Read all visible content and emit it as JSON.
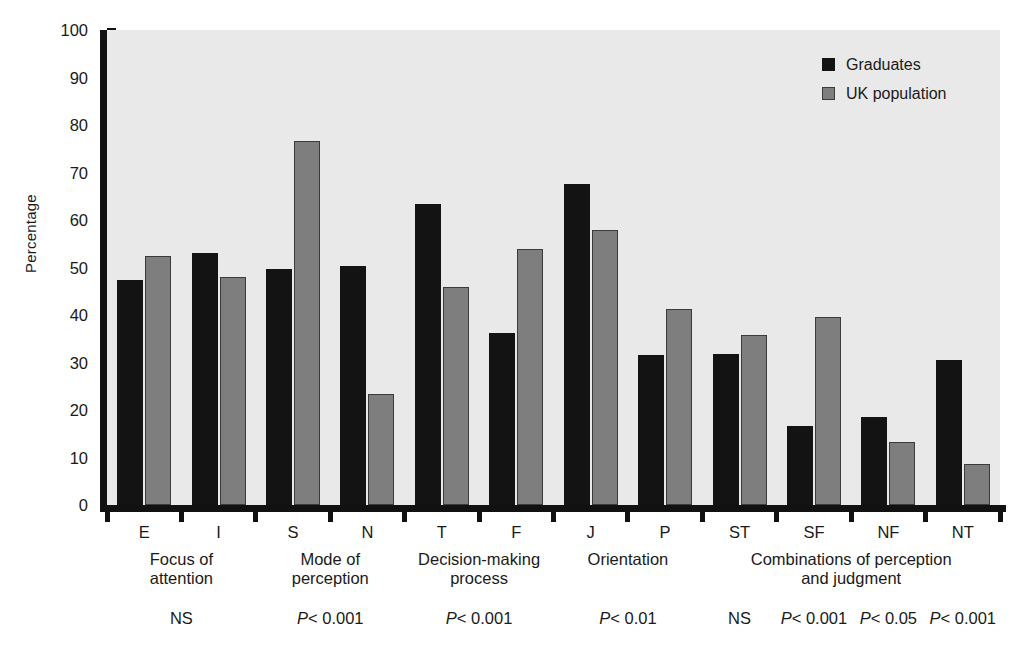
{
  "chart_data": {
    "type": "bar",
    "title": "",
    "xlabel": "",
    "ylabel": "Percentage",
    "ylim": [
      0,
      100
    ],
    "ytick_values": [
      0,
      10,
      20,
      30,
      40,
      50,
      60,
      70,
      80,
      90,
      100
    ],
    "grid": false,
    "legend_position": "top-right",
    "categories": [
      "E",
      "I",
      "S",
      "N",
      "T",
      "F",
      "J",
      "P",
      "ST",
      "SF",
      "NF",
      "NT"
    ],
    "series": [
      {
        "name": "Graduates",
        "color": "#131313",
        "values": [
          47.3,
          53.0,
          49.6,
          50.3,
          63.4,
          36.2,
          67.6,
          31.6,
          31.8,
          16.6,
          18.5,
          30.6
        ]
      },
      {
        "name": "UK population",
        "color": "#7e7e7e",
        "values": [
          52.4,
          47.9,
          76.6,
          23.4,
          45.8,
          54.0,
          57.8,
          41.3,
          35.8,
          39.5,
          13.2,
          8.7
        ]
      }
    ],
    "groups": [
      {
        "label": "Focus of\nattention",
        "categories": [
          "E",
          "I"
        ],
        "significance": "NS",
        "significance_italic": false
      },
      {
        "label": "Mode of\nperception",
        "categories": [
          "S",
          "N"
        ],
        "significance": "P< 0.001",
        "significance_italic": true
      },
      {
        "label": "Decision-making\nprocess",
        "categories": [
          "T",
          "F"
        ],
        "significance": "P< 0.001",
        "significance_italic": true
      },
      {
        "label": "Orientation",
        "categories": [
          "J",
          "P"
        ],
        "significance": "P< 0.01",
        "significance_italic": true
      },
      {
        "label": "Combinations of perception\nand judgment",
        "categories": [
          "ST",
          "SF",
          "NF",
          "NT"
        ],
        "significance": "NS  P< 0.001  P< 0.05  P< 0.001",
        "significance_italic": true
      }
    ],
    "significance_labels": [
      {
        "text": "NS",
        "italic_prefix": false,
        "after_category": "I"
      },
      {
        "text": "P< 0.001",
        "italic_prefix": true,
        "after_category": "N"
      },
      {
        "text": "P< 0.001",
        "italic_prefix": true,
        "after_category": "F"
      },
      {
        "text": "P< 0.01",
        "italic_prefix": true,
        "after_category": "P"
      },
      {
        "text": "NS",
        "italic_prefix": false,
        "after_category": "ST"
      },
      {
        "text": "P< 0.001",
        "italic_prefix": true,
        "after_category": "SF"
      },
      {
        "text": "P< 0.05",
        "italic_prefix": true,
        "after_category": "NF"
      },
      {
        "text": "P< 0.001",
        "italic_prefix": true,
        "after_category": "NT"
      }
    ]
  },
  "legend": {
    "items": [
      {
        "label": "Graduates",
        "swatch": "graduates"
      },
      {
        "label": "UK population",
        "swatch": "ukpop"
      }
    ]
  },
  "colors": {
    "graduates": "#131313",
    "uk_population": "#7e7e7e",
    "plot_background": "#e9e9e9",
    "axis": "#111111",
    "page_background": "#ffffff"
  }
}
